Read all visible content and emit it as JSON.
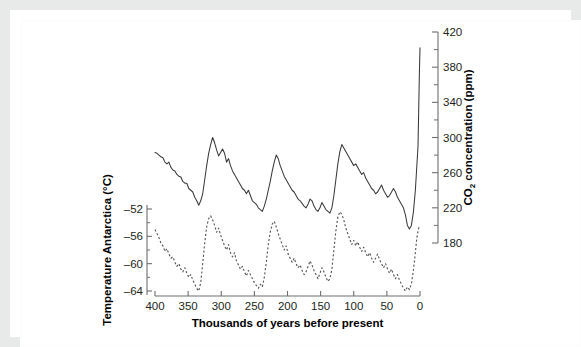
{
  "figure": {
    "background_color": "#ffffff",
    "frame_color": "#e8e9e9",
    "line_color_co2": "#3a3a3c",
    "line_color_temp": "#58585b",
    "axis_color": "#6d6e70"
  },
  "chart_data": {
    "type": "line",
    "title": "",
    "subtitle": "",
    "xlabel": "Thousands of years before present",
    "xlim": [
      400,
      0
    ],
    "x_reversed": true,
    "grid": false,
    "legend": "none",
    "x_ticks": [
      400,
      350,
      300,
      250,
      200,
      150,
      100,
      50,
      0
    ],
    "x_tick_labels": [
      "400",
      "350",
      "300",
      "250",
      "200",
      "150",
      "100",
      "50",
      "0"
    ],
    "axes": [
      {
        "id": "left",
        "position": "left",
        "label": "Temperature Antarctica (°C)",
        "label_plain": "Temperature Antarctica (degrees C)",
        "unit": "°C",
        "lim": [
          -66,
          -50
        ],
        "ticks": [
          -52,
          -56,
          -60,
          -64
        ],
        "tick_labels": [
          "–52",
          "–56",
          "–60",
          "–64"
        ],
        "minor_ticks": [
          -54,
          -58,
          -62
        ]
      },
      {
        "id": "right",
        "position": "right",
        "label": "CO₂ concentration (ppm)",
        "label_main": "CO",
        "label_subscript": "2",
        "label_rest": " concentration (ppm)",
        "unit": "ppm",
        "lim": [
          180,
          420
        ],
        "ticks": [
          420,
          380,
          340,
          300,
          260,
          220,
          180
        ],
        "tick_labels": [
          "420",
          "380",
          "340",
          "300",
          "260",
          "220",
          "180"
        ],
        "minor_ticks": [
          400,
          360,
          320,
          280,
          240,
          200
        ]
      }
    ],
    "series": [
      {
        "name": "CO2 concentration",
        "axis": "right",
        "unit": "ppm",
        "style": "solid",
        "color": "#3a3a3c",
        "x": [
          400,
          397,
          394,
          391,
          388,
          385,
          382,
          379,
          376,
          373,
          370,
          367,
          364,
          361,
          358,
          355,
          352,
          349,
          346,
          343,
          340,
          337,
          334,
          331,
          328,
          325,
          322,
          319,
          316,
          313,
          310,
          307,
          304,
          301,
          298,
          295,
          292,
          289,
          286,
          283,
          280,
          277,
          274,
          271,
          268,
          265,
          262,
          259,
          256,
          253,
          250,
          247,
          244,
          241,
          238,
          235,
          232,
          229,
          226,
          223,
          220,
          217,
          214,
          211,
          208,
          205,
          202,
          199,
          196,
          193,
          190,
          187,
          184,
          181,
          178,
          175,
          172,
          169,
          166,
          163,
          160,
          157,
          154,
          151,
          148,
          145,
          142,
          139,
          136,
          133,
          130,
          127,
          124,
          121,
          118,
          115,
          112,
          109,
          106,
          103,
          100,
          97,
          94,
          91,
          88,
          85,
          82,
          79,
          76,
          73,
          70,
          67,
          64,
          61,
          58,
          55,
          52,
          49,
          46,
          43,
          40,
          37,
          34,
          31,
          28,
          25,
          22,
          19,
          16,
          13,
          10,
          7,
          5,
          3,
          2,
          1,
          0
        ],
        "values": [
          283,
          282,
          280,
          278,
          277,
          272,
          270,
          272,
          266,
          263,
          262,
          258,
          256,
          255,
          250,
          248,
          248,
          242,
          240,
          238,
          232,
          228,
          223,
          228,
          236,
          252,
          268,
          282,
          292,
          300,
          294,
          286,
          279,
          283,
          287,
          282,
          272,
          276,
          268,
          262,
          258,
          254,
          250,
          246,
          242,
          240,
          236,
          240,
          234,
          228,
          226,
          224,
          220,
          218,
          216,
          222,
          230,
          240,
          250,
          262,
          272,
          280,
          276,
          268,
          262,
          256,
          252,
          248,
          244,
          240,
          238,
          234,
          230,
          228,
          225,
          222,
          220,
          224,
          230,
          228,
          222,
          218,
          216,
          220,
          226,
          222,
          218,
          216,
          214,
          220,
          234,
          252,
          270,
          284,
          292,
          288,
          284,
          280,
          276,
          272,
          268,
          270,
          266,
          262,
          258,
          260,
          254,
          250,
          246,
          242,
          240,
          236,
          238,
          242,
          246,
          240,
          236,
          232,
          234,
          238,
          242,
          238,
          232,
          228,
          224,
          220,
          212,
          200,
          196,
          200,
          215,
          240,
          265,
          290,
          330,
          370,
          402
        ]
      },
      {
        "name": "Temperature Antarctica",
        "axis": "left",
        "unit": "°C",
        "style": "dashed",
        "color": "#58585b",
        "x": [
          400,
          397,
          394,
          391,
          388,
          385,
          382,
          379,
          376,
          373,
          370,
          367,
          364,
          361,
          358,
          355,
          352,
          349,
          346,
          343,
          340,
          337,
          334,
          331,
          328,
          325,
          322,
          319,
          316,
          313,
          310,
          307,
          304,
          301,
          298,
          295,
          292,
          289,
          286,
          283,
          280,
          277,
          274,
          271,
          268,
          265,
          262,
          259,
          256,
          253,
          250,
          247,
          244,
          241,
          238,
          235,
          232,
          229,
          226,
          223,
          220,
          217,
          214,
          211,
          208,
          205,
          202,
          199,
          196,
          193,
          190,
          187,
          184,
          181,
          178,
          175,
          172,
          169,
          166,
          163,
          160,
          157,
          154,
          151,
          148,
          145,
          142,
          139,
          136,
          133,
          130,
          127,
          124,
          121,
          118,
          115,
          112,
          109,
          106,
          103,
          100,
          97,
          94,
          91,
          88,
          85,
          82,
          79,
          76,
          73,
          70,
          67,
          64,
          61,
          58,
          55,
          52,
          49,
          46,
          43,
          40,
          37,
          34,
          31,
          28,
          25,
          22,
          19,
          16,
          13,
          10,
          7,
          5,
          3,
          2,
          1,
          0
        ],
        "values": [
          -55.0,
          -55.6,
          -56.2,
          -57.0,
          -57.4,
          -58.2,
          -57.8,
          -58.6,
          -59.2,
          -59.0,
          -59.8,
          -60.4,
          -60.0,
          -60.8,
          -61.2,
          -60.6,
          -61.4,
          -62.0,
          -61.6,
          -62.4,
          -63.0,
          -63.6,
          -64.0,
          -62.8,
          -60.0,
          -57.0,
          -54.6,
          -53.4,
          -53.0,
          -53.6,
          -54.4,
          -55.4,
          -54.8,
          -55.8,
          -56.6,
          -57.4,
          -58.0,
          -57.2,
          -58.4,
          -59.0,
          -58.4,
          -59.6,
          -60.2,
          -60.8,
          -60.4,
          -61.2,
          -61.8,
          -61.0,
          -61.6,
          -62.2,
          -62.8,
          -63.2,
          -63.6,
          -63.0,
          -63.4,
          -62.0,
          -59.8,
          -57.2,
          -55.4,
          -54.2,
          -53.8,
          -54.6,
          -55.6,
          -56.4,
          -57.2,
          -58.0,
          -57.4,
          -58.6,
          -59.2,
          -59.8,
          -59.2,
          -60.0,
          -60.6,
          -60.2,
          -61.0,
          -61.6,
          -61.2,
          -60.4,
          -59.6,
          -60.2,
          -61.0,
          -61.6,
          -62.2,
          -61.4,
          -60.6,
          -61.2,
          -62.0,
          -62.6,
          -62.2,
          -60.8,
          -58.0,
          -55.2,
          -53.2,
          -52.4,
          -52.8,
          -53.6,
          -54.8,
          -55.6,
          -56.4,
          -57.2,
          -56.6,
          -57.4,
          -56.8,
          -57.6,
          -58.2,
          -57.6,
          -58.4,
          -59.0,
          -58.4,
          -59.2,
          -59.8,
          -59.2,
          -58.6,
          -59.4,
          -60.0,
          -60.6,
          -60.0,
          -60.8,
          -61.4,
          -60.8,
          -61.6,
          -62.2,
          -61.6,
          -62.4,
          -63.0,
          -63.6,
          -64.0,
          -63.4,
          -63.8,
          -63.0,
          -61.0,
          -58.4,
          -56.4,
          -55.2,
          -54.8,
          -54.6,
          -54.4
        ]
      }
    ]
  }
}
